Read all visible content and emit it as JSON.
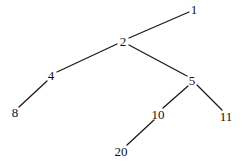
{
  "diagram": {
    "type": "binary-tree",
    "colors": {
      "background": "#ffffff",
      "edge": "#1a1a1a",
      "label": "#111111"
    },
    "nodes": [
      {
        "id": "n1",
        "label": "1",
        "x": 194,
        "y": 9
      },
      {
        "id": "n2",
        "label": "2",
        "x": 123,
        "y": 41
      },
      {
        "id": "n4",
        "label": "4",
        "x": 51,
        "y": 75
      },
      {
        "id": "n5",
        "label": "5",
        "x": 192,
        "y": 80
      },
      {
        "id": "n8",
        "label": "8",
        "x": 15,
        "y": 112
      },
      {
        "id": "n10",
        "label": "10",
        "x": 158,
        "y": 114
      },
      {
        "id": "n11",
        "label": "11",
        "x": 226,
        "y": 116
      },
      {
        "id": "n20",
        "label": "20",
        "x": 121,
        "y": 151
      }
    ],
    "edges": [
      {
        "from": "1",
        "to": "2",
        "x1": 189,
        "y1": 12,
        "x2": 129,
        "y2": 38
      },
      {
        "from": "2",
        "to": "4",
        "x1": 117,
        "y1": 44,
        "x2": 57,
        "y2": 72
      },
      {
        "from": "2",
        "to": "5",
        "x1": 129,
        "y1": 45,
        "x2": 187,
        "y2": 76
      },
      {
        "from": "4",
        "to": "8",
        "x1": 47,
        "y1": 81,
        "x2": 19,
        "y2": 107
      },
      {
        "from": "5",
        "to": "10",
        "x1": 188,
        "y1": 86,
        "x2": 163,
        "y2": 108
      },
      {
        "from": "5",
        "to": "11",
        "x1": 197,
        "y1": 85,
        "x2": 222,
        "y2": 110
      },
      {
        "from": "10",
        "to": "20",
        "x1": 154,
        "y1": 120,
        "x2": 127,
        "y2": 145
      }
    ]
  }
}
